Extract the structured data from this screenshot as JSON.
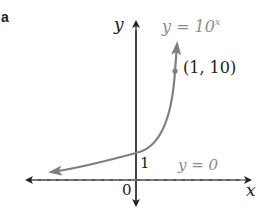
{
  "panel_label": "a",
  "axes": {
    "x_label": "x",
    "y_label": "y",
    "origin_label": "0",
    "y_intercept_label": "1"
  },
  "curve": {
    "label_lhs": "y = 10",
    "label_exponent": "x",
    "point_label": "(1, 10)",
    "point": [
      1,
      10
    ],
    "color": "#7f7f7f"
  },
  "asymptote": {
    "label": "y = 0",
    "color": "#9a9a9a"
  },
  "colors": {
    "axis": "#222222",
    "curve": "#7f7f7f"
  }
}
